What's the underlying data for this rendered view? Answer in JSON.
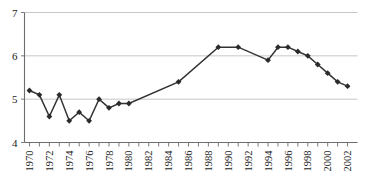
{
  "chart_data": {
    "type": "line",
    "title": "",
    "subtitle": "",
    "xlabel": "",
    "ylabel": "",
    "xlim": [
      1969.5,
      2003.0
    ],
    "ylim": [
      4,
      7
    ],
    "yticks": [
      4,
      5,
      6,
      7
    ],
    "ytick_labels": [
      "4",
      "5",
      "6",
      "7"
    ],
    "xticks": [
      1970,
      1971,
      1972,
      1973,
      1974,
      1975,
      1976,
      1977,
      1978,
      1979,
      1980,
      1981,
      1982,
      1983,
      1984,
      1985,
      1986,
      1987,
      1988,
      1989,
      1990,
      1991,
      1992,
      1993,
      1994,
      1995,
      1996,
      1997,
      1998,
      1999,
      2000,
      2001,
      2002
    ],
    "xtick_labels": [
      "1970",
      "",
      "1972",
      "",
      "1974",
      "",
      "1976",
      "",
      "1978",
      "",
      "1980",
      "",
      "1982",
      "",
      "1984",
      "",
      "1986",
      "",
      "1988",
      "",
      "1990",
      "",
      "1992",
      "",
      "1994",
      "",
      "1996",
      "",
      "1998",
      "",
      "2000",
      "",
      "2002"
    ],
    "xtick_label_rotation": -90,
    "grid": "horizontal",
    "legend": "none",
    "series": [
      {
        "name": "series-1",
        "marker": "diamond",
        "color": "#333333",
        "x": [
          1970,
          1971,
          1972,
          1973,
          1974,
          1975,
          1976,
          1977,
          1978,
          1979,
          1980,
          1985,
          1989,
          1991,
          1994,
          1995,
          1996,
          1997,
          1998,
          1999,
          2000,
          2001,
          2002
        ],
        "y": [
          5.2,
          5.1,
          4.6,
          5.1,
          4.5,
          4.7,
          4.5,
          5.0,
          4.8,
          4.9,
          4.9,
          5.4,
          6.2,
          6.2,
          5.9,
          6.2,
          6.2,
          6.1,
          6.0,
          5.8,
          5.6,
          5.4,
          5.3
        ]
      }
    ],
    "points": [
      {
        "year": 1970,
        "value": 5.2
      },
      {
        "year": 1971,
        "value": 5.1
      },
      {
        "year": 1972,
        "value": 4.6
      },
      {
        "year": 1973,
        "value": 5.1
      },
      {
        "year": 1974,
        "value": 4.5
      },
      {
        "year": 1975,
        "value": 4.7
      },
      {
        "year": 1976,
        "value": 4.5
      },
      {
        "year": 1977,
        "value": 5.0
      },
      {
        "year": 1978,
        "value": 4.8
      },
      {
        "year": 1979,
        "value": 4.9
      },
      {
        "year": 1980,
        "value": 4.9
      },
      {
        "year": 1985,
        "value": 5.4
      },
      {
        "year": 1989,
        "value": 6.2
      },
      {
        "year": 1991,
        "value": 6.2
      },
      {
        "year": 1994,
        "value": 5.9
      },
      {
        "year": 1995,
        "value": 6.2
      },
      {
        "year": 1996,
        "value": 6.2
      },
      {
        "year": 1997,
        "value": 6.1
      },
      {
        "year": 1998,
        "value": 6.0
      },
      {
        "year": 1999,
        "value": 5.8
      },
      {
        "year": 2000,
        "value": 5.6
      },
      {
        "year": 2001,
        "value": 5.4
      },
      {
        "year": 2002,
        "value": 5.3
      }
    ],
    "colors": {
      "line": "#333333",
      "marker": "#2b2b2b",
      "grid": "#b8b8b8",
      "axis": "#6d6d6d",
      "background": "#ffffff",
      "text": "#1a1a1a"
    }
  }
}
